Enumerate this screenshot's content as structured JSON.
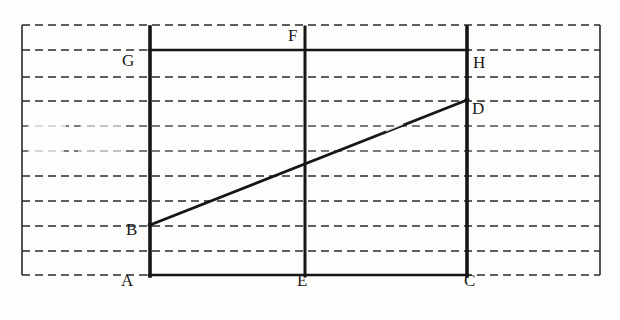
{
  "figure": {
    "type": "geometry-diagram",
    "background_color": "#fdfdfc",
    "ink_color": "#1b1b1b",
    "rule_color": "#2a2a2a",
    "ghost_caption": "",
    "labels": [
      {
        "id": "A",
        "text": "A",
        "x": 121,
        "y": 280,
        "role": "bottom-left-vertex"
      },
      {
        "id": "B",
        "text": "B",
        "x": 126,
        "y": 228,
        "role": "segment-start-on-left-side"
      },
      {
        "id": "C",
        "text": "C",
        "x": 464,
        "y": 280,
        "role": "bottom-right-vertex"
      },
      {
        "id": "D",
        "text": "D",
        "x": 472,
        "y": 107,
        "role": "segment-end-on-right-side"
      },
      {
        "id": "E",
        "text": "E",
        "x": 297,
        "y": 280,
        "role": "bottom-midpoint"
      },
      {
        "id": "F",
        "text": "F",
        "x": 288,
        "y": 30,
        "role": "top-midpoint"
      },
      {
        "id": "G",
        "text": "G",
        "x": 122,
        "y": 53,
        "role": "upper-left-vertex"
      },
      {
        "id": "H",
        "text": "H",
        "x": 473,
        "y": 55,
        "role": "upper-right-vertex"
      }
    ],
    "ruled_lines": {
      "count": 11,
      "y_positions": [
        25,
        50,
        77,
        101,
        126,
        151,
        176,
        201,
        226,
        251,
        275
      ],
      "x_start": 22,
      "x_end": 600,
      "dash": "7 5",
      "faded_indices": [
        4,
        5
      ]
    },
    "margins": {
      "left_rule_x": 22,
      "right_rule_x": 600,
      "top_y": 25,
      "bottom_y": 275
    },
    "shape": {
      "rect_left_x": 150,
      "rect_right_x": 467,
      "rect_top_y": 50,
      "rect_bottom_y": 275,
      "vertical_left_top_y": 27,
      "vertical_right_top_y": 27,
      "mid_vertical_x": 305,
      "mid_vertical_top_y": 27,
      "segment": {
        "x1": 150,
        "y1": 225,
        "x2": 467,
        "y2": 100
      }
    }
  }
}
